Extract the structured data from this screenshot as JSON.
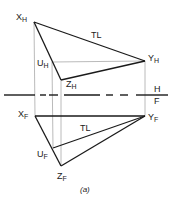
{
  "figure": {
    "caption": "(a)",
    "colors": {
      "object_line": "#1a1a1a",
      "projector": "#a8a8a8",
      "fold_line": "#1a1a1a"
    },
    "fold_line": {
      "y": 95,
      "upper_label": "H",
      "lower_label": "F",
      "segments": [
        [
          4,
          35
        ],
        [
          40,
          46
        ],
        [
          49,
          58
        ],
        [
          64,
          100
        ],
        [
          106,
          113
        ],
        [
          120,
          128
        ],
        [
          136,
          168
        ]
      ]
    },
    "top_view": {
      "points": {
        "X": {
          "x": 34,
          "y": 22,
          "name": "X",
          "sub": "H"
        },
        "Y": {
          "x": 145,
          "y": 61,
          "name": "Y",
          "sub": "H"
        },
        "U": {
          "x": 52,
          "y": 62,
          "name": "U",
          "sub": "H"
        },
        "Z": {
          "x": 61,
          "y": 80,
          "name": "Z",
          "sub": "H"
        }
      },
      "true_length_label": "TL"
    },
    "front_view": {
      "points": {
        "X": {
          "x": 35,
          "y": 116,
          "name": "X",
          "sub": "F"
        },
        "Y": {
          "x": 145,
          "y": 116,
          "name": "Y",
          "sub": "F"
        },
        "U": {
          "x": 53,
          "y": 148,
          "name": "U",
          "sub": "F"
        },
        "Z": {
          "x": 61,
          "y": 166,
          "name": "Z",
          "sub": "F"
        }
      },
      "true_length_label": "TL"
    }
  }
}
